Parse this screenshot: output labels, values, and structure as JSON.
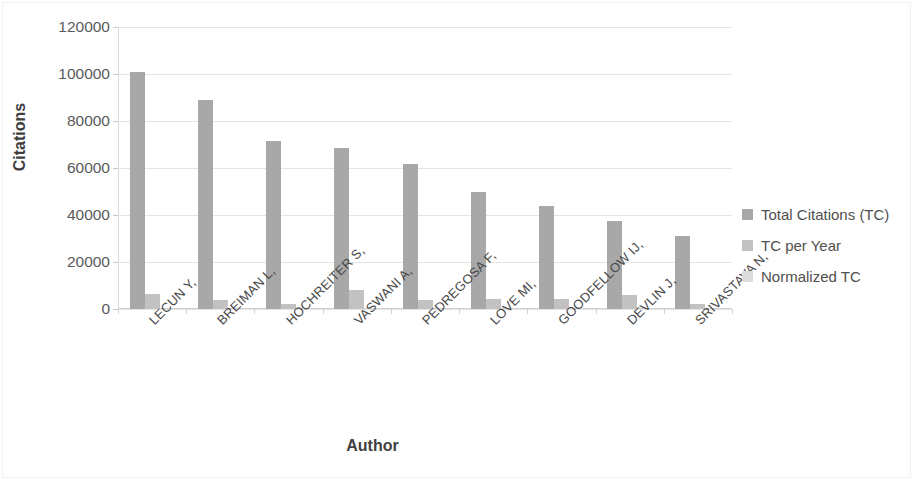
{
  "chart_data": {
    "type": "bar",
    "title": "",
    "xlabel": "Author",
    "ylabel": "Citations",
    "ylim": [
      0,
      120000
    ],
    "ytick_labels": [
      "120000",
      "100000",
      "80000",
      "60000",
      "40000",
      "20000",
      "0"
    ],
    "yticks": [
      120000,
      100000,
      80000,
      60000,
      40000,
      20000,
      0
    ],
    "grid": true,
    "legend_position": "right",
    "categories": [
      "LECUN Y,",
      "BREIMAN L,",
      "HOCHREITER S,",
      "VASWANI A,",
      "PEDREGOSA F,",
      "LOVE MI,",
      "GOODFELLOW IJ,",
      "DEVLIN J,",
      "SRIVASTAVA N,"
    ],
    "series": [
      {
        "name": "Total Citations (TC)",
        "color": "#a8a8a8",
        "values": [
          101000,
          89000,
          71500,
          68500,
          61500,
          50000,
          44000,
          37500,
          31000
        ]
      },
      {
        "name": "TC per Year",
        "color": "#c2c2c2",
        "values": [
          6200,
          3900,
          2300,
          8000,
          4000,
          4300,
          4200,
          6100,
          2200
        ]
      },
      {
        "name": "Normalized TC",
        "color": "#dcdcdc",
        "values": [
          0,
          0,
          0,
          0,
          0,
          0,
          0,
          0,
          0
        ]
      }
    ]
  },
  "legend": {
    "items": [
      {
        "label": "Total Citations (TC)"
      },
      {
        "label": "TC per Year"
      },
      {
        "label": "Normalized TC"
      }
    ]
  }
}
